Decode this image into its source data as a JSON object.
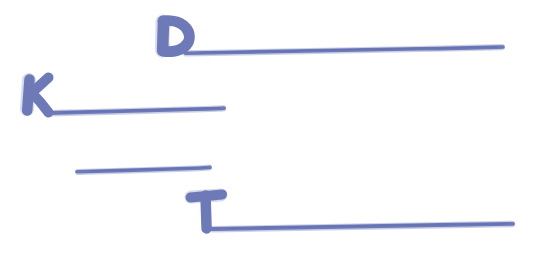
{
  "canvas": {
    "width": 535,
    "height": 266,
    "background_color": "#ffffff",
    "ink_color": "#6e7ab8",
    "ink_color_light": "#8d97c9",
    "style": "hand-drawn marker sketch",
    "title": "Handwritten blue marker letters with underlines"
  },
  "letters": [
    {
      "id": "letter-d",
      "character": "D",
      "x": 155,
      "y": 18,
      "width": 36,
      "height": 35
    },
    {
      "id": "letter-k",
      "character": "K",
      "x": 20,
      "y": 76,
      "width": 33,
      "height": 37
    },
    {
      "id": "letter-t",
      "character": "T",
      "x": 189,
      "y": 192,
      "width": 34,
      "height": 37
    }
  ],
  "lines": [
    {
      "id": "line-d",
      "label": "D",
      "x_start": 185,
      "x_end": 503,
      "y_start": 53,
      "y_end": 47,
      "length": 318,
      "thickness": 4
    },
    {
      "id": "line-k",
      "label": "K",
      "x_start": 48,
      "x_end": 224,
      "y_start": 113,
      "y_end": 108,
      "length": 176,
      "thickness": 4
    },
    {
      "id": "line-unlabeled",
      "label": "",
      "x_start": 77,
      "x_end": 210,
      "y_start": 172,
      "y_end": 167,
      "length": 133,
      "thickness": 4
    },
    {
      "id": "line-t",
      "label": "T",
      "x_start": 212,
      "x_end": 513,
      "y_start": 229,
      "y_end": 224,
      "length": 301,
      "thickness": 4
    }
  ]
}
